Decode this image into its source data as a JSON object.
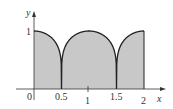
{
  "figure": {
    "axis_labels": {
      "x": "x",
      "y": "y"
    },
    "x_ticks": [
      {
        "value": 0,
        "label": "0"
      },
      {
        "value": 0.5,
        "label": "0.5"
      },
      {
        "value": 1,
        "label": "1"
      },
      {
        "value": 1.5,
        "label": "1.5"
      },
      {
        "value": 2,
        "label": "2"
      }
    ],
    "y_ticks": [
      {
        "value": 1,
        "label": "1"
      }
    ],
    "colors": {
      "fill": "#c8c8c8",
      "curve": "#222222",
      "axis": "#333333"
    }
  },
  "chart_data": {
    "type": "area",
    "title": "",
    "xlabel": "x",
    "ylabel": "y",
    "xlim": [
      0,
      2
    ],
    "ylim": [
      0,
      1
    ],
    "x": [
      0,
      0.25,
      0.5,
      0.75,
      1,
      1.25,
      1.5,
      1.75,
      2
    ],
    "values": [
      1,
      0.92,
      0,
      0.92,
      1,
      0.92,
      0,
      0.92,
      1
    ]
  }
}
